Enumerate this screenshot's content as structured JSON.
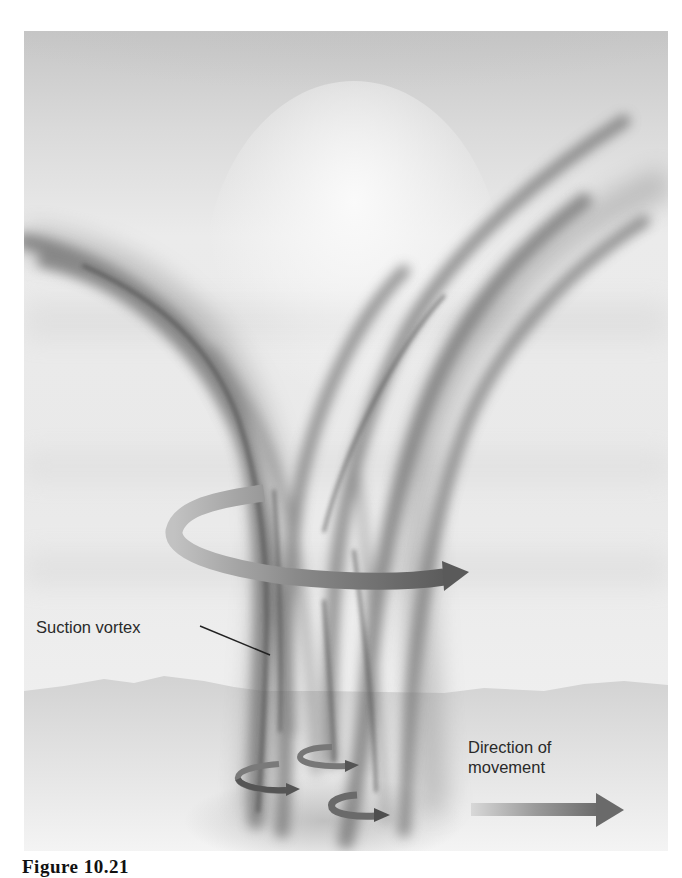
{
  "figure": {
    "caption": "Figure 10.21",
    "labels": {
      "suction_vortex": "Suction vortex",
      "direction_of_movement_line1": "Direction of",
      "direction_of_movement_line2": "movement"
    },
    "elements": {
      "main_rotation_arrow": "counterclockwise-rotation-arrow",
      "small_rotation_arrows": [
        "suction-vortex-rotation-1",
        "suction-vortex-rotation-2",
        "suction-vortex-rotation-3"
      ],
      "movement_arrow": "direction-arrow-right"
    },
    "colors": {
      "sky_top": "#c8c8c8",
      "sky_mid": "#eeeeee",
      "ground": "#d2d2d2",
      "vortex_dark": "#5a5a5a",
      "arrow_dark": "#555555",
      "arrow_light": "#b4b4b4"
    }
  }
}
